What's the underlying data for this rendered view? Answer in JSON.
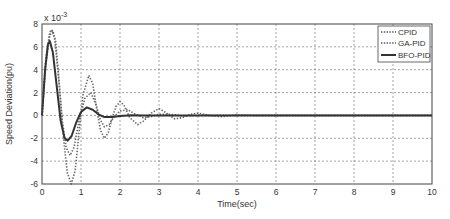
{
  "chart_data": {
    "type": "line",
    "title": "",
    "xlabel": "Time(sec)",
    "ylabel": "Speed Deviation(pu)",
    "y_multiplier": "x 10",
    "y_exponent": "-3",
    "xlim": [
      0,
      10
    ],
    "ylim": [
      -6,
      8
    ],
    "x_ticks": [
      0,
      1,
      2,
      3,
      4,
      5,
      6,
      7,
      8,
      9,
      10
    ],
    "y_ticks": [
      -6,
      -4,
      -2,
      0,
      2,
      4,
      6,
      8
    ],
    "grid": true,
    "legend_position": "upper right",
    "series": [
      {
        "name": "CPID",
        "style": "dotted",
        "points": [
          [
            0,
            0
          ],
          [
            0.1,
            4.5
          ],
          [
            0.2,
            7.0
          ],
          [
            0.28,
            7.4
          ],
          [
            0.35,
            6.5
          ],
          [
            0.45,
            2.5
          ],
          [
            0.55,
            -2.0
          ],
          [
            0.65,
            -5.0
          ],
          [
            0.75,
            -6.0
          ],
          [
            0.85,
            -4.8
          ],
          [
            0.95,
            -1.5
          ],
          [
            1.05,
            1.8
          ],
          [
            1.2,
            3.5
          ],
          [
            1.3,
            2.8
          ],
          [
            1.4,
            0.6
          ],
          [
            1.5,
            -1.3
          ],
          [
            1.6,
            -2.0
          ],
          [
            1.7,
            -1.5
          ],
          [
            1.8,
            -0.2
          ],
          [
            1.9,
            0.8
          ],
          [
            2.0,
            1.2
          ],
          [
            2.1,
            0.9
          ],
          [
            2.25,
            -0.2
          ],
          [
            2.45,
            -0.8
          ],
          [
            2.6,
            -0.5
          ],
          [
            2.8,
            0.2
          ],
          [
            3.0,
            0.6
          ],
          [
            3.15,
            0.3
          ],
          [
            3.4,
            -0.3
          ],
          [
            3.6,
            -0.2
          ],
          [
            3.8,
            0.1
          ],
          [
            4.0,
            0.2
          ],
          [
            4.3,
            0.0
          ],
          [
            4.6,
            -0.1
          ],
          [
            5.0,
            0.05
          ],
          [
            5.5,
            0
          ],
          [
            6,
            0
          ],
          [
            7,
            0
          ],
          [
            8,
            0
          ],
          [
            9,
            0
          ],
          [
            10,
            0
          ]
        ]
      },
      {
        "name": "GA-PID",
        "style": "dotted",
        "points": [
          [
            0,
            0
          ],
          [
            0.1,
            5.0
          ],
          [
            0.2,
            7.3
          ],
          [
            0.25,
            7.5
          ],
          [
            0.32,
            6.8
          ],
          [
            0.42,
            3.5
          ],
          [
            0.52,
            -0.5
          ],
          [
            0.62,
            -2.8
          ],
          [
            0.72,
            -3.5
          ],
          [
            0.82,
            -2.8
          ],
          [
            0.95,
            -0.5
          ],
          [
            1.1,
            1.5
          ],
          [
            1.25,
            2.0
          ],
          [
            1.38,
            1.0
          ],
          [
            1.5,
            -0.4
          ],
          [
            1.6,
            -1.0
          ],
          [
            1.72,
            -0.8
          ],
          [
            1.85,
            -0.1
          ],
          [
            2.0,
            0.4
          ],
          [
            2.2,
            0.5
          ],
          [
            2.4,
            0.1
          ],
          [
            2.6,
            -0.2
          ],
          [
            2.8,
            -0.1
          ],
          [
            3.0,
            0.1
          ],
          [
            3.3,
            0.1
          ],
          [
            3.6,
            -0.05
          ],
          [
            4.0,
            0
          ],
          [
            5,
            0
          ],
          [
            6,
            0
          ],
          [
            7,
            0
          ],
          [
            8,
            0
          ],
          [
            9,
            0
          ],
          [
            10,
            0
          ]
        ]
      },
      {
        "name": "BFO-PID",
        "style": "solid",
        "points": [
          [
            0,
            0
          ],
          [
            0.08,
            4.0
          ],
          [
            0.15,
            6.2
          ],
          [
            0.2,
            6.5
          ],
          [
            0.28,
            5.5
          ],
          [
            0.38,
            2.5
          ],
          [
            0.48,
            -0.5
          ],
          [
            0.58,
            -2.0
          ],
          [
            0.66,
            -2.2
          ],
          [
            0.76,
            -1.8
          ],
          [
            0.88,
            -0.6
          ],
          [
            1.0,
            0.3
          ],
          [
            1.15,
            0.7
          ],
          [
            1.3,
            0.5
          ],
          [
            1.45,
            0.1
          ],
          [
            1.6,
            -0.15
          ],
          [
            1.8,
            -0.15
          ],
          [
            2.0,
            -0.05
          ],
          [
            2.3,
            0.02
          ],
          [
            2.6,
            0
          ],
          [
            3,
            0
          ],
          [
            4,
            0
          ],
          [
            5,
            0
          ],
          [
            6,
            0
          ],
          [
            7,
            0
          ],
          [
            8,
            0
          ],
          [
            9,
            0
          ],
          [
            10,
            0
          ]
        ]
      }
    ]
  },
  "legend": {
    "items": [
      {
        "label": "CPID",
        "style": "dotted"
      },
      {
        "label": "GA-PID",
        "style": "dotted"
      },
      {
        "label": "BFO-PID",
        "style": "solid"
      }
    ]
  },
  "colors": {
    "axis": "#444444",
    "grid": "#555555",
    "series": "#555555"
  }
}
